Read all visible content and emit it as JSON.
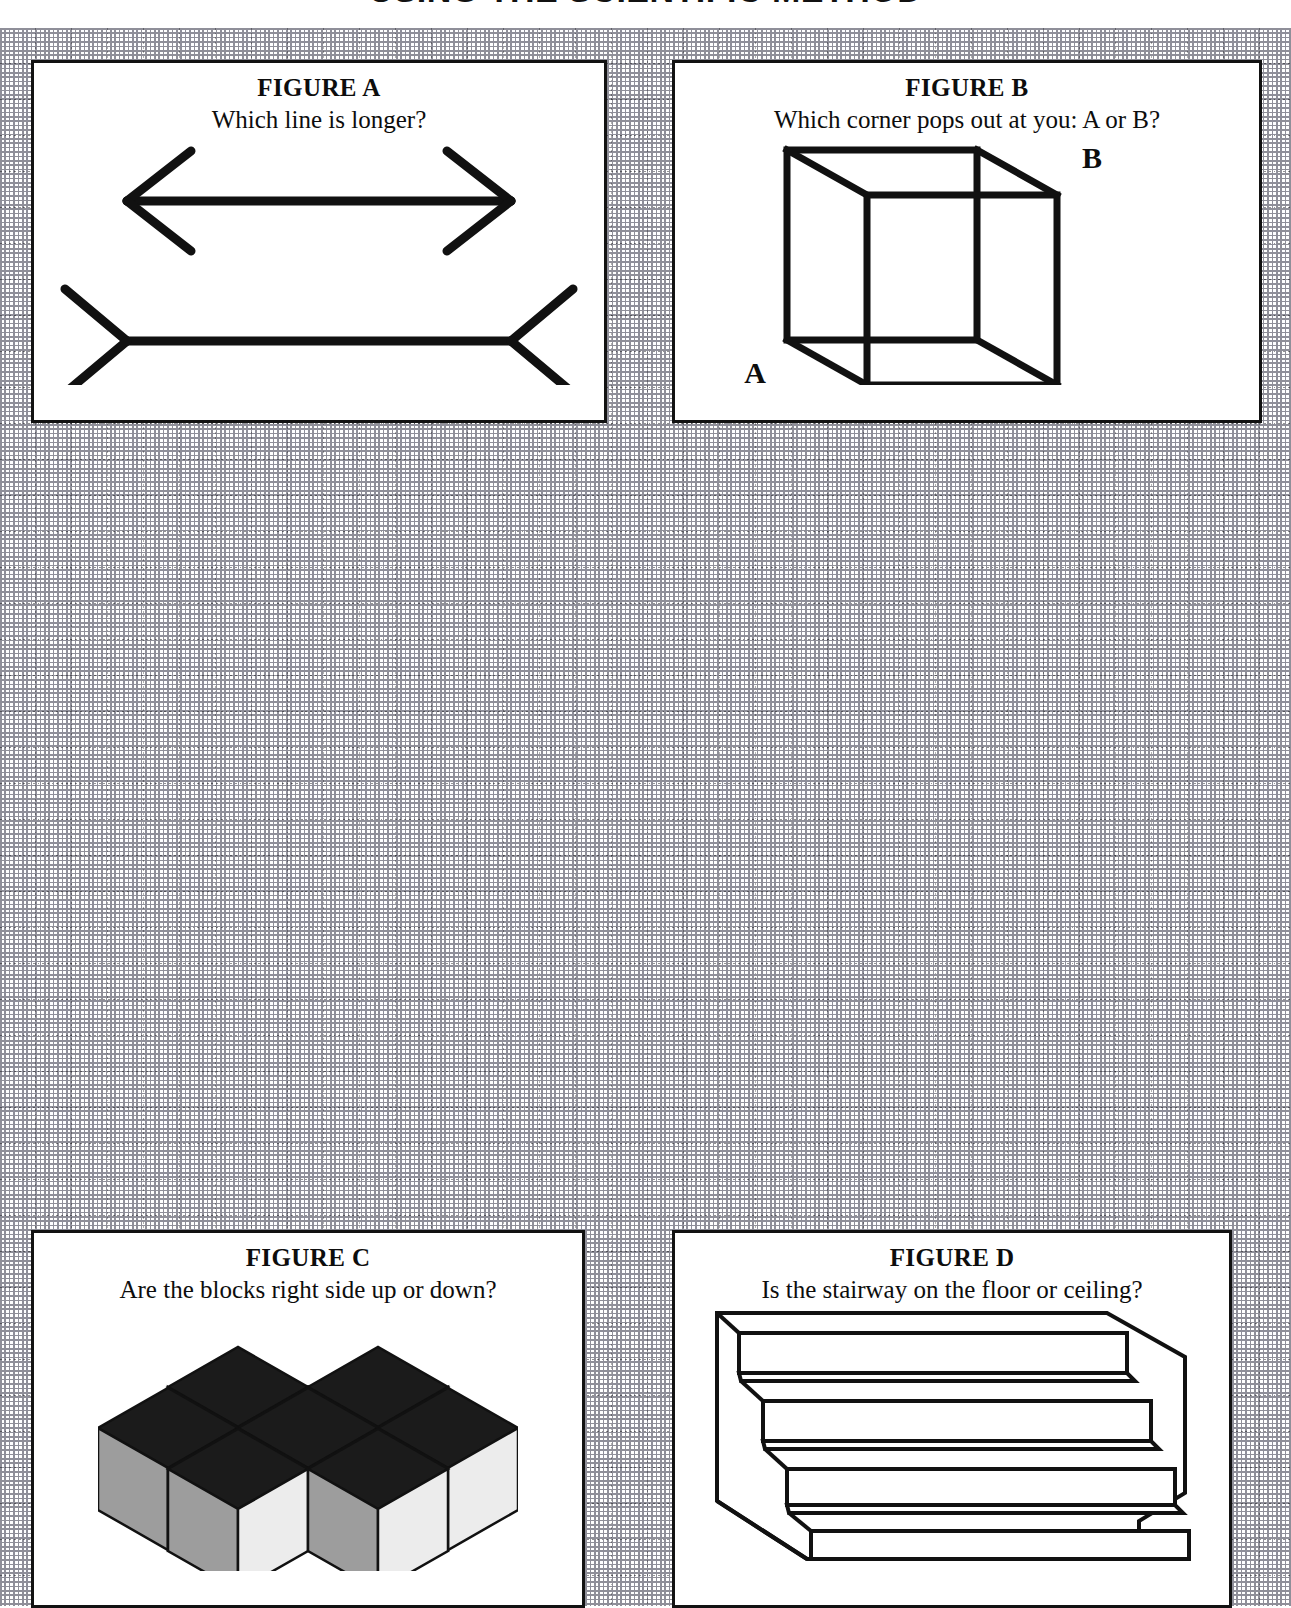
{
  "worksheet": {
    "title": "USING THE SCIENTIFIC METHOD",
    "background": "dotted graph paper grid",
    "grid_cell_px": 36,
    "colors": {
      "paper": "#ffffff",
      "ink": "#121212",
      "grid": "#9a9aa3",
      "cube_top_dark": "#1b1b1b",
      "cube_left_gray": "#9d9d9d",
      "cube_right_light": "#ececec"
    }
  },
  "figures": [
    {
      "id": "a",
      "label": "FIGURE A",
      "question": "Which line is longer?",
      "illusion": "muller-lyer",
      "lines": [
        {
          "name": "top-line",
          "fins": "outward-arrowheads"
        },
        {
          "name": "bottom-line",
          "fins": "inward-arrowheads"
        }
      ]
    },
    {
      "id": "b",
      "label": "FIGURE B",
      "question": "Which corner pops out at you: A or B?",
      "illusion": "necker-cube",
      "corner_labels": [
        "A",
        "B"
      ]
    },
    {
      "id": "c",
      "label": "FIGURE C",
      "question": "Are the blocks right side up or down?",
      "illusion": "isometric-cube-stack",
      "cube_rows": [
        2,
        3,
        4
      ],
      "face_shades": {
        "top": "#1b1b1b",
        "left": "#9d9d9d",
        "right": "#ececec"
      }
    },
    {
      "id": "d",
      "label": "FIGURE D",
      "question": "Is the stairway on the floor or ceiling?",
      "illusion": "schroeder-staircase",
      "step_count": 4
    }
  ]
}
